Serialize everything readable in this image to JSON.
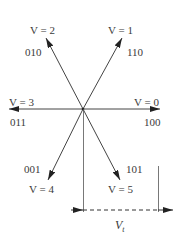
{
  "diagram": {
    "vectors": [
      {
        "label": "V = 0",
        "code": "100",
        "angle_deg": 0
      },
      {
        "label": "V = 1",
        "code": "110",
        "angle_deg": 60
      },
      {
        "label": "V = 2",
        "code": "010",
        "angle_deg": 120
      },
      {
        "label": "V = 3",
        "code": "011",
        "angle_deg": 180
      },
      {
        "label": "V = 4",
        "code": "001",
        "angle_deg": 240
      },
      {
        "label": "V = 5",
        "code": "101",
        "angle_deg": 300
      }
    ],
    "dimension": {
      "label_main": "V",
      "label_sub": "t"
    },
    "colors": {
      "line": "#444444",
      "text": "#3a3a3a"
    }
  }
}
